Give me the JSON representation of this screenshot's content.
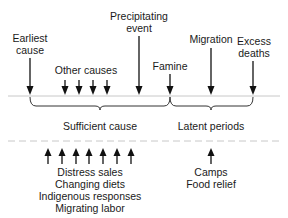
{
  "top_labels": {
    "earliest_cause": [
      "Earliest",
      "cause"
    ],
    "other_causes": "Other causes",
    "precipitating_event": [
      "Precipitating",
      "event"
    ],
    "famine": "Famine",
    "migration": "Migration",
    "excess_deaths": [
      "Excess",
      "deaths"
    ]
  },
  "brace_labels": {
    "sufficient_cause": "Sufficient cause",
    "latent_periods": "Latent periods"
  },
  "bottom_labels": {
    "left": [
      "Distress sales",
      "Changing diets",
      "Indigenous responses",
      "Migrating labor"
    ],
    "right": [
      "Camps",
      "Food relief"
    ]
  },
  "colors": {
    "text": "#1a1a1a",
    "arrow": "#111111",
    "timeline": "#c8c8c8",
    "dashed": "#c8c8c8",
    "brace": "#333333"
  }
}
